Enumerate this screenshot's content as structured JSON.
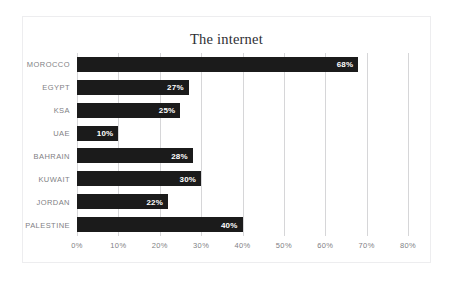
{
  "chart_data": {
    "type": "bar",
    "orientation": "horizontal",
    "title": "The internet",
    "xlabel": "",
    "ylabel": "",
    "categories": [
      "MOROCCO",
      "EGYPT",
      "KSA",
      "UAE",
      "BAHRAIN",
      "KUWAIT",
      "JORDAN",
      "PALESTINE"
    ],
    "values": [
      68,
      27,
      25,
      10,
      28,
      30,
      22,
      40
    ],
    "value_labels": [
      "68%",
      "27%",
      "25%",
      "10%",
      "28%",
      "30%",
      "22%",
      "40%"
    ],
    "xlim": [
      0,
      80
    ],
    "xticks": [
      0,
      10,
      20,
      30,
      40,
      50,
      60,
      70,
      80
    ],
    "xtick_labels": [
      "0%",
      "10%",
      "20%",
      "30%",
      "40%",
      "50%",
      "60%",
      "70%",
      "80%"
    ],
    "grid": "vertical",
    "legend": "none",
    "bar_color": "#1b1b1b",
    "label_color": "#7f7f85",
    "gridline_color": "#d6d6d8",
    "value_label_color": "#ffffff",
    "frame_border_color": "#ededef",
    "background": "#ffffff"
  }
}
